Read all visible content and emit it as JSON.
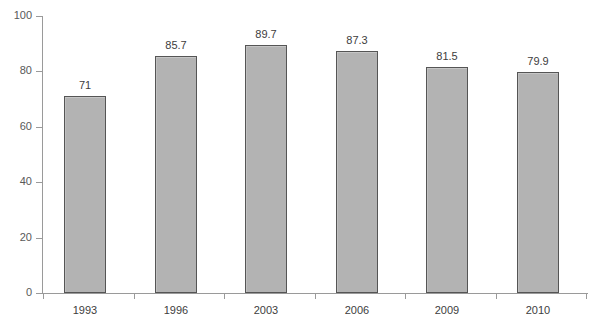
{
  "chart_data": {
    "type": "bar",
    "title": "",
    "subtitle": "",
    "xlabel": "",
    "ylabel": "",
    "categories": [
      "1993",
      "1996",
      "2003",
      "2006",
      "2009",
      "2010"
    ],
    "values": [
      71,
      85.7,
      89.7,
      87.3,
      81.5,
      79.9
    ],
    "value_labels": [
      "71",
      "85.7",
      "89.7",
      "87.3",
      "81.5",
      "79.9"
    ],
    "ylim": [
      0,
      100
    ],
    "y_ticks": [
      0,
      20,
      40,
      60,
      80,
      100
    ],
    "y_tick_labels": [
      "0",
      "20",
      "40",
      "60",
      "80",
      "100"
    ],
    "grid": false,
    "legend": null,
    "legend_position": "none",
    "bar_fill_color": "#b3b3b3",
    "bar_border_color": "#555555",
    "axis_color": "#9a9a9a",
    "text_color": "#3d3d3d",
    "background_color": "#ffffff"
  }
}
